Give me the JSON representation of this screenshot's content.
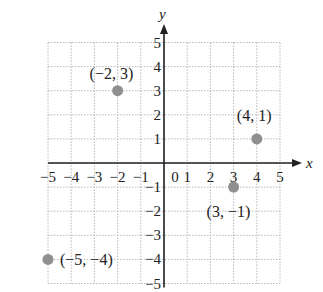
{
  "chart_data": {
    "type": "scatter",
    "title": "",
    "xlabel": "x",
    "ylabel": "y",
    "xlim": [
      -5,
      5
    ],
    "ylim": [
      -5,
      5
    ],
    "grid": true,
    "legend": null,
    "x_ticks": [
      "−5",
      "−4",
      "−3",
      "−2",
      "−1",
      "0",
      "1",
      "2",
      "3",
      "4",
      "5"
    ],
    "y_ticks": [
      "−5",
      "−4",
      "−3",
      "−2",
      "−1",
      "1",
      "2",
      "3",
      "4",
      "5"
    ],
    "points": [
      {
        "x": -2,
        "y": 3,
        "label": "(−2, 3)"
      },
      {
        "x": 4,
        "y": 1,
        "label": "(4, 1)"
      },
      {
        "x": 3,
        "y": -1,
        "label": "(3, −1)"
      },
      {
        "x": -5,
        "y": -4,
        "label": "(−5, −4)"
      }
    ],
    "colors": {
      "point": "#8f8f8f",
      "axis": "#222222",
      "grid": "#b8b8b8"
    }
  }
}
